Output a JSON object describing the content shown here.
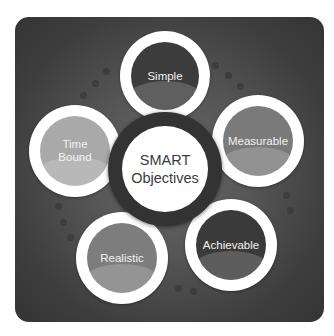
{
  "diagram": {
    "title": "SMART\nObjectives",
    "panel_color": "#4a4a4a",
    "center": {
      "label": "SMART\nObjectives",
      "ring_color": "#333333",
      "fill_color": "#ffffff"
    },
    "nodes": [
      {
        "id": "simple",
        "label": "Simple",
        "fill_color": "#3c3c3c"
      },
      {
        "id": "measurable",
        "label": "Measurable",
        "fill_color": "#7a7a7a"
      },
      {
        "id": "achievable",
        "label": "Achievable",
        "fill_color": "#3a3a3a"
      },
      {
        "id": "realistic",
        "label": "Realistic",
        "fill_color": "#7d7d7d"
      },
      {
        "id": "time-bound",
        "label": "Time\nBound",
        "fill_color": "#a9a9a9"
      }
    ]
  }
}
